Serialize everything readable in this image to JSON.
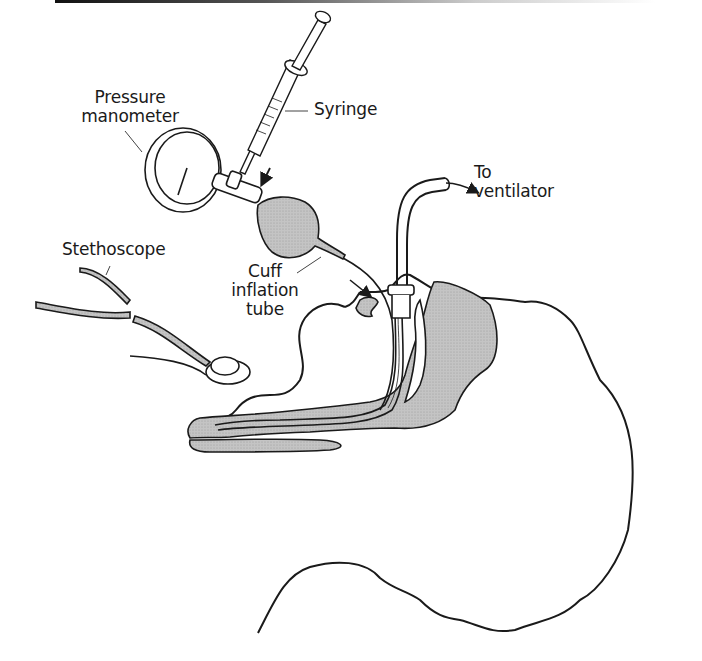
{
  "figure": {
    "type": "medical-illustration",
    "labels": {
      "pressure_manometer_line1": "Pressure",
      "pressure_manometer_line2": "manometer",
      "syringe": "Syringe",
      "to_ventilator_line1": "To",
      "to_ventilator_line2": "ventilator",
      "stethoscope": "Stethoscope",
      "cuff_inflation_tube_line1": "Cuff",
      "cuff_inflation_tube_line2": "inflation",
      "cuff_inflation_tube_line3": "tube"
    },
    "colors": {
      "line": "#1a1a1a",
      "shading": "#b8b8b8",
      "background": "#ffffff"
    }
  }
}
